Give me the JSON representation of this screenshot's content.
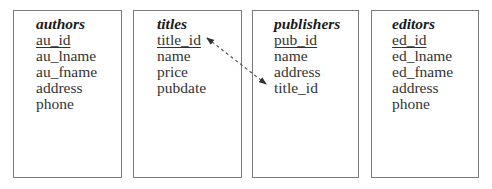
{
  "diagram": {
    "tables": [
      {
        "name": "authors",
        "fields": [
          {
            "label": "au_id",
            "primary_key": true
          },
          {
            "label": "au_lname",
            "primary_key": false
          },
          {
            "label": "au_fname",
            "primary_key": false
          },
          {
            "label": "address",
            "primary_key": false
          },
          {
            "label": "phone",
            "primary_key": false
          }
        ]
      },
      {
        "name": "titles",
        "fields": [
          {
            "label": "title_id",
            "primary_key": true
          },
          {
            "label": "name",
            "primary_key": false
          },
          {
            "label": "price",
            "primary_key": false
          },
          {
            "label": "pubdate",
            "primary_key": false
          }
        ]
      },
      {
        "name": "publishers",
        "fields": [
          {
            "label": "pub_id",
            "primary_key": true
          },
          {
            "label": "name",
            "primary_key": false
          },
          {
            "label": "address",
            "primary_key": false
          },
          {
            "label": "title_id",
            "primary_key": false
          }
        ]
      },
      {
        "name": "editors",
        "fields": [
          {
            "label": "ed_id",
            "primary_key": true
          },
          {
            "label": "ed_lname",
            "primary_key": false
          },
          {
            "label": "ed_fname",
            "primary_key": false
          },
          {
            "label": "address",
            "primary_key": false
          },
          {
            "label": "phone",
            "primary_key": false
          }
        ]
      }
    ],
    "relationships": [
      {
        "from": "titles.title_id",
        "to": "publishers.title_id",
        "style": "dashed",
        "arrowheads": "both"
      }
    ],
    "colors": {
      "border": "#7a7a7a",
      "text": "#333333",
      "arrow": "#333333"
    }
  }
}
